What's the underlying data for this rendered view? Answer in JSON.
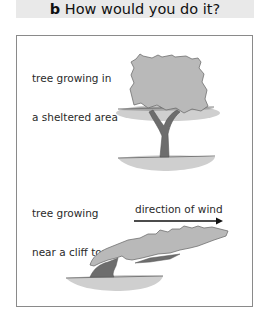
{
  "header": {
    "letter": "b",
    "title": "How would you do it?"
  },
  "figure": {
    "sheltered_label_line1": "tree growing in",
    "sheltered_label_line2": "a sheltered area",
    "cliff_label_line1": "tree growing",
    "cliff_label_line2": "near a cliff top",
    "wind_label": "direction of wind"
  },
  "colors": {
    "header_bg": "#e9e9e9",
    "canopy": "#b9b9b9",
    "trunk": "#6d6d6d",
    "ground": "#cfcfcf",
    "frame": "#8a8a8a"
  }
}
